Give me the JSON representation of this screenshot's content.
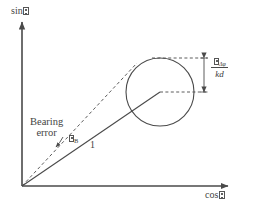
{
  "figure": {
    "background_color": "#ffffff",
    "line_color": "#4a4a4a",
    "text_color": "#444444"
  },
  "axes": {
    "y_label_prefix": "sin",
    "y_label_symbol": "theta-tofu",
    "x_label_prefix": "cos",
    "x_label_symbol": "theta-tofu",
    "origin": {
      "x": 22,
      "y": 186
    },
    "x_axis_end": {
      "x": 232,
      "y": 186
    },
    "y_axis_end": {
      "x": 22,
      "y": 20
    }
  },
  "annotations": {
    "bearing_error_line1": "Bearing",
    "bearing_error_line2": "error",
    "angle_symbol": "epsilon-tofu",
    "angle_subscript": "B",
    "unit_vector_label": "1",
    "sigma_numerator_symbol": "sigma-tofu",
    "sigma_numerator_subscript": "Δφ",
    "sigma_denominator": "kd"
  },
  "geometry": {
    "circle_center": {
      "x": 160,
      "y": 92
    },
    "circle_radius": 34,
    "solid_vector_from": {
      "x": 22,
      "y": 186
    },
    "solid_vector_to": {
      "x": 160,
      "y": 92
    },
    "dashed_vector_from": {
      "x": 22,
      "y": 186
    },
    "dashed_vector_to": {
      "x": 136,
      "y": 63
    },
    "top_dashed_y": 58,
    "center_dashed_y": 92,
    "measure_arrow_x": 204,
    "measure_top_y": 58,
    "measure_bottom_y": 92
  }
}
